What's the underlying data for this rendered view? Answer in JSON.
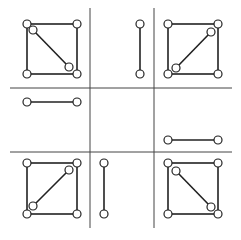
{
  "diagram": {
    "width": 241,
    "height": 240,
    "stroke_color": "#222222",
    "grid_color": "#444444",
    "node_fill": "#ffffff",
    "grid_lines": [
      {
        "id": "v1",
        "x1": 90,
        "y1": 8,
        "x2": 90,
        "y2": 228
      },
      {
        "id": "v2",
        "x1": 154,
        "y1": 8,
        "x2": 154,
        "y2": 228
      },
      {
        "id": "h1",
        "x1": 10,
        "y1": 88,
        "x2": 232,
        "y2": 88
      },
      {
        "id": "h2",
        "x1": 10,
        "y1": 152,
        "x2": 232,
        "y2": 152
      }
    ],
    "cells": [
      {
        "name": "top-left",
        "type": "square-with-diagonal",
        "square": [
          27,
          24,
          77,
          74
        ],
        "diagonal": [
          33,
          30,
          69,
          67
        ]
      },
      {
        "name": "top-middle",
        "type": "vertical-segment",
        "segment": [
          140,
          24,
          140,
          74
        ]
      },
      {
        "name": "top-right",
        "type": "square-with-diagonal",
        "square": [
          168,
          24,
          218,
          74
        ],
        "diagonal": [
          211,
          32,
          176,
          68
        ]
      },
      {
        "name": "middle-left",
        "type": "horizontal-segment",
        "segment": [
          27,
          102,
          77,
          102
        ]
      },
      {
        "name": "middle-right",
        "type": "horizontal-segment",
        "segment": [
          168,
          140,
          218,
          140
        ]
      },
      {
        "name": "bottom-left",
        "type": "square-with-diagonal",
        "square": [
          27,
          163,
          77,
          214
        ],
        "diagonal": [
          69,
          170,
          33,
          206
        ]
      },
      {
        "name": "bottom-middle",
        "type": "vertical-segment",
        "segment": [
          104,
          163,
          104,
          214
        ]
      },
      {
        "name": "bottom-right",
        "type": "square-with-diagonal",
        "square": [
          168,
          163,
          218,
          214
        ],
        "diagonal": [
          176,
          171,
          211,
          207
        ]
      }
    ]
  }
}
